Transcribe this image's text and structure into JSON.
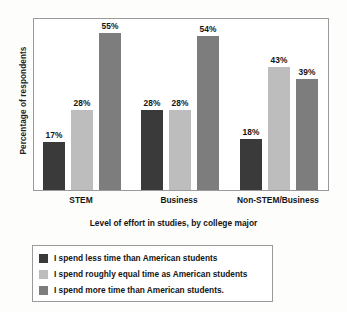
{
  "chart_data": {
    "type": "bar",
    "title": "",
    "xlabel": "Level of effort in studies, by college major",
    "ylabel": "Percentage of respondents",
    "categories": [
      "STEM",
      "Business",
      "Non-STEM/Business"
    ],
    "ylim": [
      0,
      60
    ],
    "grid": false,
    "legend_position": "below-plot",
    "value_suffix": "%",
    "series": [
      {
        "name": "I spend less time than American students",
        "color": "#3a3a3a",
        "values": [
          17,
          28,
          18
        ],
        "labels": [
          "17%",
          "28%",
          "18%"
        ]
      },
      {
        "name": "I spend roughly equal time as American students",
        "color": "#bdbdbd",
        "values": [
          28,
          28,
          43
        ],
        "labels": [
          "28%",
          "28%",
          "43%"
        ]
      },
      {
        "name": "I spend more time than American students.",
        "color": "#7d7d7d",
        "values": [
          55,
          54,
          39
        ],
        "labels": [
          "55%",
          "54%",
          "39%"
        ]
      }
    ],
    "bars": [
      {
        "group": "STEM",
        "series": "I spend less time than American students",
        "value": 17,
        "label": "17%",
        "color": "#3a3a3a"
      },
      {
        "group": "STEM",
        "series": "I spend roughly equal time as American students",
        "value": 28,
        "label": "28%",
        "color": "#bdbdbd"
      },
      {
        "group": "STEM",
        "series": "I spend more time than American students.",
        "value": 55,
        "label": "55%",
        "color": "#7d7d7d"
      },
      {
        "group": "Business",
        "series": "I spend less time than American students",
        "value": 18,
        "label": "18%",
        "color": "#3a3a3a"
      },
      {
        "group": "Business",
        "series": "I spend roughly equal time as American students",
        "value": 28,
        "label": "28%",
        "color": "#bdbdbd"
      },
      {
        "group": "Business",
        "series": "I spend more time than American students.",
        "value": 54,
        "label": "54%",
        "color": "#7d7d7d"
      },
      {
        "group": "Non-STEM/Business",
        "series": "I spend less time than American students",
        "value": 18,
        "label": "18%",
        "color": "#3a3a3a"
      },
      {
        "group": "Non-STEM/Business",
        "series": "I spend roughly equal time as American students",
        "value": 43,
        "label": "43%",
        "color": "#bdbdbd"
      },
      {
        "group": "Non-STEM/Business",
        "series": "I spend more time than American students.",
        "value": 39,
        "label": "39%",
        "color": "#7d7d7d"
      }
    ]
  },
  "colors": {
    "less_time": "#3a3a3a",
    "equal_time": "#bdbdbd",
    "more_time": "#7d7d7d",
    "frame": "#9a9a9a",
    "background": "#fdfdfb",
    "plot_background": "#ffffff"
  },
  "legend": {
    "items": [
      {
        "label": "I spend less time than American students",
        "color": "#3a3a3a"
      },
      {
        "label": "I spend roughly equal time as American students",
        "color": "#bdbdbd"
      },
      {
        "label": "I spend more time than American students.",
        "color": "#7d7d7d"
      }
    ]
  }
}
